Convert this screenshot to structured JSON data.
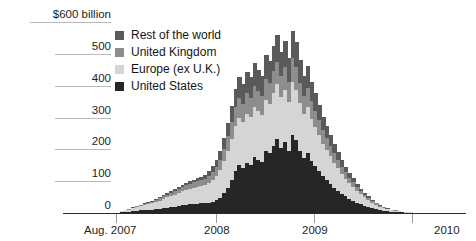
{
  "chart_data": {
    "type": "area",
    "title": "",
    "subtitle": "",
    "xlabel": "",
    "ylabel": "$600 billion",
    "unit_note": "$600 billion",
    "ylim": [
      0,
      600
    ],
    "ytick_labels": [
      "$600 billion",
      "500",
      "400",
      "300",
      "200",
      "100",
      "0"
    ],
    "ytick_values": [
      600,
      500,
      400,
      300,
      200,
      100,
      0
    ],
    "grid": true,
    "legend_position": "inside-top-left",
    "xtick_labels": [
      "Aug. 2007",
      "2008",
      "2009",
      "2010"
    ],
    "xtick_values": [
      "2007-08",
      "2008-01",
      "2009-01",
      "2010-01"
    ],
    "x_range": [
      "Aug. 2007",
      "2010"
    ],
    "stacked": true,
    "series_order_bottom_to_top": [
      "United States",
      "Europe (ex U.K.)",
      "United Kingdom",
      "Rest of the world"
    ],
    "series": [
      {
        "name": "United States",
        "color": "#262626",
        "values": [
          0,
          2,
          3,
          4,
          6,
          7,
          8,
          9,
          10,
          11,
          12,
          13,
          15,
          17,
          18,
          20,
          22,
          24,
          26,
          27,
          28,
          29,
          30,
          31,
          33,
          36,
          40,
          48,
          62,
          80,
          104,
          132,
          150,
          140,
          158,
          152,
          176,
          168,
          160,
          196,
          188,
          212,
          232,
          205,
          224,
          196,
          244,
          228,
          196,
          172,
          188,
          164,
          148,
          132,
          116,
          104,
          92,
          80,
          70,
          60,
          52,
          44,
          38,
          32,
          27,
          22,
          18,
          15,
          12,
          9,
          7,
          5,
          4,
          3,
          2,
          2,
          1,
          1
        ]
      },
      {
        "name": "Europe (ex U.K.)",
        "color": "#d5d5d5",
        "values": [
          0,
          3,
          5,
          7,
          9,
          11,
          13,
          15,
          17,
          20,
          23,
          26,
          29,
          32,
          35,
          38,
          41,
          44,
          47,
          50,
          52,
          54,
          56,
          58,
          62,
          68,
          76,
          86,
          100,
          116,
          130,
          142,
          150,
          146,
          154,
          150,
          158,
          152,
          148,
          160,
          156,
          166,
          172,
          158,
          164,
          152,
          168,
          160,
          150,
          138,
          144,
          132,
          122,
          112,
          102,
          94,
          86,
          78,
          70,
          62,
          56,
          49,
          43,
          37,
          32,
          27,
          22,
          18,
          14,
          11,
          9,
          7,
          5,
          4,
          3,
          2,
          2,
          1
        ]
      },
      {
        "name": "United Kingdom",
        "color": "#8d8d8d",
        "values": [
          0,
          1,
          1,
          2,
          2,
          3,
          3,
          4,
          4,
          5,
          6,
          7,
          8,
          9,
          10,
          11,
          12,
          13,
          14,
          15,
          16,
          17,
          18,
          19,
          22,
          26,
          30,
          34,
          40,
          46,
          52,
          58,
          62,
          58,
          64,
          60,
          66,
          62,
          60,
          66,
          64,
          68,
          72,
          66,
          70,
          64,
          74,
          70,
          64,
          58,
          62,
          56,
          52,
          47,
          42,
          38,
          34,
          30,
          27,
          23,
          20,
          17,
          15,
          12,
          10,
          8,
          7,
          5,
          4,
          3,
          2,
          2,
          1,
          1,
          1,
          0,
          0,
          0
        ]
      },
      {
        "name": "Rest of the world",
        "color": "#5a5a5a",
        "values": [
          0,
          0,
          1,
          1,
          1,
          2,
          2,
          2,
          3,
          3,
          4,
          4,
          5,
          5,
          6,
          6,
          7,
          7,
          8,
          8,
          9,
          9,
          10,
          10,
          14,
          18,
          22,
          28,
          34,
          42,
          50,
          58,
          64,
          60,
          68,
          64,
          72,
          68,
          64,
          74,
          70,
          78,
          84,
          76,
          82,
          74,
          86,
          80,
          72,
          64,
          68,
          60,
          54,
          48,
          43,
          38,
          33,
          29,
          25,
          21,
          18,
          15,
          13,
          10,
          8,
          7,
          5,
          4,
          3,
          2,
          2,
          1,
          1,
          1,
          0,
          0,
          0,
          0
        ]
      }
    ],
    "n_points": 79,
    "peak_total_approx": 520,
    "colors": {
      "rest_of_the_world": "#5a5a5a",
      "united_kingdom": "#8d8d8d",
      "europe_ex_uk": "#d5d5d5",
      "united_states": "#262626",
      "gridline": "#b9b9b9",
      "axis": "#2a2a2a",
      "text": "#1d1d1d"
    }
  },
  "legend": {
    "items": [
      {
        "label": "Rest of the world",
        "color": "#5a5a5a"
      },
      {
        "label": "United Kingdom",
        "color": "#8d8d8d"
      },
      {
        "label": "Europe (ex U.K.)",
        "color": "#d5d5d5"
      },
      {
        "label": "United States",
        "color": "#262626"
      }
    ]
  },
  "axes": {
    "y": {
      "ticks": [
        {
          "label": "$600 billion",
          "value": 600
        },
        {
          "label": "500",
          "value": 500
        },
        {
          "label": "400",
          "value": 400
        },
        {
          "label": "300",
          "value": 300
        },
        {
          "label": "200",
          "value": 200
        },
        {
          "label": "100",
          "value": 100
        },
        {
          "label": "0",
          "value": 0
        }
      ]
    },
    "x": {
      "ticks": [
        {
          "label": "Aug. 2007",
          "pos": 0.0
        },
        {
          "label": "2008",
          "pos": 0.3378
        },
        {
          "label": "2009",
          "pos": 0.6689
        },
        {
          "label": "2010",
          "pos": 1.0
        }
      ]
    }
  }
}
